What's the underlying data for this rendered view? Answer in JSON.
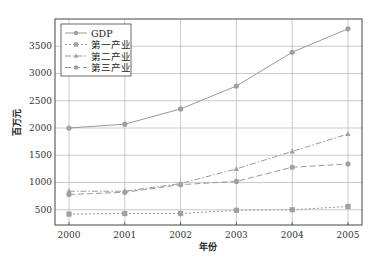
{
  "chart_data": {
    "type": "line",
    "title": "",
    "xlabel": "年份",
    "ylabel": "百万元",
    "x": [
      2000,
      2001,
      2002,
      2003,
      2004,
      2005
    ],
    "xticks": [
      "2000",
      "2001",
      "2002",
      "2003",
      "2004",
      "2005"
    ],
    "yticks": [
      500,
      1000,
      1500,
      2000,
      2500,
      3000,
      3500
    ],
    "ylim": [
      220,
      4000
    ],
    "grid": true,
    "legend_position": "upper left",
    "series": [
      {
        "name": "GDP",
        "marker": "circle",
        "linestyle": "solid",
        "values": [
          2000,
          2070,
          2350,
          2770,
          3390,
          3820
        ]
      },
      {
        "name": "第一产业",
        "marker": "square",
        "linestyle": "dotted",
        "values": [
          420,
          430,
          430,
          490,
          500,
          560
        ]
      },
      {
        "name": "第二产业",
        "marker": "triangle",
        "linestyle": "dashdot",
        "values": [
          840,
          840,
          980,
          1250,
          1570,
          1890
        ]
      },
      {
        "name": "第三产业",
        "marker": "circle",
        "linestyle": "dashed",
        "values": [
          780,
          820,
          960,
          1020,
          1280,
          1340
        ]
      }
    ]
  },
  "colors": {
    "line": "#999999",
    "marker": "#a0a0a0",
    "grid": "#bdbdbd",
    "frame": "#444444"
  }
}
